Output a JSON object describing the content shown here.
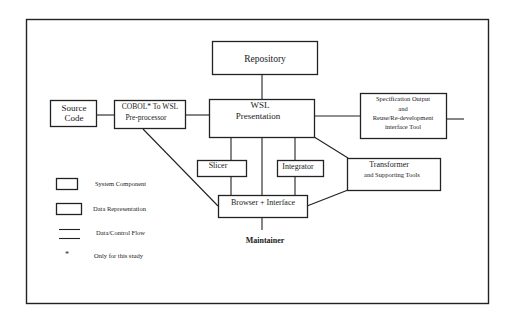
{
  "diagram": {
    "nodes": {
      "repository": {
        "label": "Repository"
      },
      "source_code": {
        "line1": "Source",
        "line2": "Code"
      },
      "preprocessor": {
        "line1": "COBOL* To WSL",
        "line2": "Pre-processor"
      },
      "wsl": {
        "line1": "WSL",
        "line2": "Presentation"
      },
      "spec_output": {
        "line1": "Specification Output",
        "line2": "and",
        "line3": "Reuse/Re-development",
        "line4": "interface Tool"
      },
      "slicer": {
        "label": "Slicer"
      },
      "integrator": {
        "label": "Integrator"
      },
      "transformer": {
        "line1": "Transformer",
        "line2": "and Supporting Tools"
      },
      "browser": {
        "label": "Browser + Interface"
      },
      "maintainer": {
        "label": "Maintainer"
      }
    },
    "edges": [
      [
        "source_code",
        "preprocessor"
      ],
      [
        "preprocessor",
        "wsl"
      ],
      [
        "repository",
        "wsl"
      ],
      [
        "wsl",
        "spec_output"
      ],
      [
        "wsl",
        "slicer"
      ],
      [
        "wsl",
        "browser"
      ],
      [
        "wsl",
        "integrator"
      ],
      [
        "wsl",
        "transformer"
      ],
      [
        "slicer",
        "browser"
      ],
      [
        "integrator",
        "browser"
      ],
      [
        "transformer",
        "browser"
      ],
      [
        "preprocessor",
        "browser"
      ],
      [
        "browser",
        "maintainer"
      ]
    ],
    "legend": {
      "system_component": "System Component",
      "data_representation": "Data Representation",
      "flow": "Data/Control Flow",
      "asterisk": "*",
      "study_note": "Only for this study"
    }
  }
}
